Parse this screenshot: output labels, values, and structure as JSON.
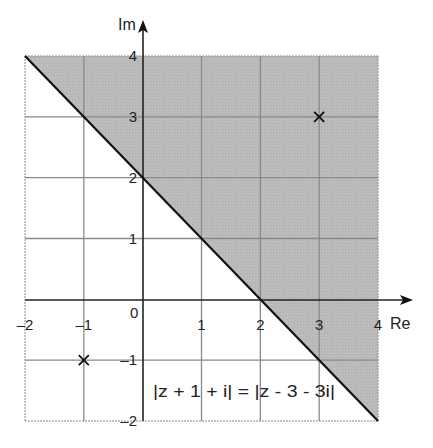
{
  "diagram": {
    "axes": {
      "x_label": "Re",
      "y_label": "Im",
      "x_range": [
        -2,
        4
      ],
      "y_range": [
        -2,
        4
      ],
      "x_ticks": [
        {
          "value": -2,
          "label": "-2"
        },
        {
          "value": -1,
          "label": "-1"
        },
        {
          "value": 1,
          "label": "1"
        },
        {
          "value": 2,
          "label": "2"
        },
        {
          "value": 3,
          "label": "3"
        },
        {
          "value": 4,
          "label": "4"
        }
      ],
      "y_ticks": [
        {
          "value": 4,
          "label": "4"
        },
        {
          "value": 3,
          "label": "3"
        },
        {
          "value": 2,
          "label": "2"
        },
        {
          "value": 1,
          "label": "1"
        },
        {
          "value": -1,
          "label": "-1"
        },
        {
          "value": -2,
          "label": "-2"
        }
      ],
      "origin_label": "0"
    },
    "points": [
      {
        "name": "point-minus1-minus1",
        "re": -1,
        "im": -1,
        "marker": "x"
      },
      {
        "name": "point-3-3",
        "re": 3,
        "im": 3,
        "marker": "x"
      }
    ],
    "locus_line": {
      "from": [
        -2,
        4
      ],
      "to": [
        4,
        -2
      ],
      "equation": "y = -x + 2"
    },
    "shaded_region": {
      "description": "half-plane above/right of locus line",
      "color": "#b9b9b9"
    },
    "equation_label": "|z + 1 + i| = |z - 3 - 3i|",
    "colors": {
      "grid": "#8a8a8a",
      "axis": "#222222",
      "shade": "#b9b9b9",
      "line": "#111111"
    }
  }
}
